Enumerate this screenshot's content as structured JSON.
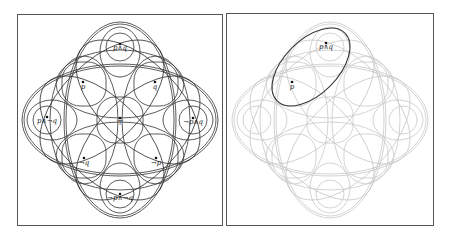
{
  "left_panel": {
    "labels": {
      "top": "p∧q",
      "upper_left": "p",
      "upper_right": "q",
      "left": "p∧¬q",
      "center": "⊤",
      "right": "¬p∧q",
      "lower_left": "¬q",
      "lower_right": "¬p",
      "bottom": "¬p∧¬q"
    },
    "stroke_color": "#333333"
  },
  "right_panel": {
    "labels": {
      "top": "p∧q",
      "upper_left": "p"
    },
    "faded_stroke_color": "#c8c8c8",
    "highlight_stroke_color": "#333333"
  }
}
